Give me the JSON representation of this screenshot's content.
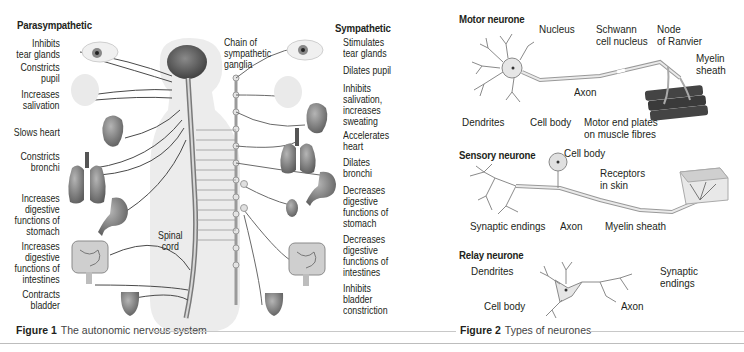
{
  "figure1": {
    "caption_number": "Figure 1",
    "caption_text": "The autonomic nervous system",
    "parasympathetic": {
      "heading": "Parasympathetic",
      "labels": [
        "Inhibits\ntear glands",
        "Constricts\npupil",
        "Increases\nsalivation",
        "Slows heart",
        "Constricts\nbronchi",
        "Increases\ndigestive\nfunctions of\nstomach",
        "Increases\ndigestive\nfunctions of\nintestines",
        "Contracts\nbladder"
      ]
    },
    "sympathetic": {
      "heading": "Sympathetic",
      "labels": [
        "Stimulates\ntear glands",
        "Dilates pupil",
        "Inhibits\nsalivation,\nincreases\nsweating",
        "Accelerates\nheart",
        "Dilates\nbronchi",
        "Decreases\ndigestive\nfunctions of\nstomach",
        "Decreases\ndigestive\nfunctions of\nintestines",
        "Inhibits\nbladder\nconstriction"
      ]
    },
    "center_labels": {
      "chain": "Chain of\nsympathetic\nganglia",
      "spinal_cord": "Spinal\ncord"
    }
  },
  "figure2": {
    "caption_number": "Figure 2",
    "caption_text": "Types of neurones",
    "motor": {
      "heading": "Motor neurone",
      "labels": {
        "nucleus": "Nucleus",
        "schwann": "Schwann\ncell nucleus",
        "node": "Node\nof Ranvier",
        "myelin": "Myelin\nsheath",
        "axon": "Axon",
        "dendrites": "Dendrites",
        "cell_body": "Cell body",
        "end_plates": "Motor end plates\non muscle fibres"
      }
    },
    "sensory": {
      "heading": "Sensory neurone",
      "labels": {
        "cell_body": "Cell body",
        "receptors": "Receptors\nin skin",
        "synaptic": "Synaptic endings",
        "axon": "Axon",
        "myelin": "Myelin sheath"
      }
    },
    "relay": {
      "heading": "Relay neurone",
      "labels": {
        "dendrites": "Dendrites",
        "synaptic": "Synaptic\nendings",
        "cell_body": "Cell body",
        "axon": "Axon"
      }
    }
  },
  "colors": {
    "text": "#231f20",
    "nerve": "#5a5a5a",
    "organ": "#7a7a7a",
    "body_silhouette": "#ececec",
    "rule": "#c8c8c8"
  }
}
